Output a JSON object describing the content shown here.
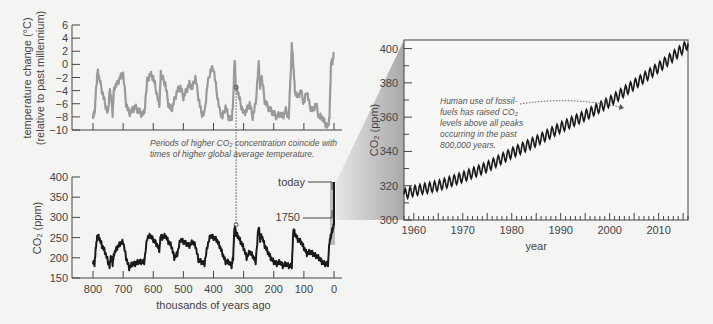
{
  "chart_data": [
    {
      "type": "line",
      "name": "temperature",
      "ylabel": "temperature change (°C)",
      "ylabel2": "(relative to past millennium)",
      "ylim": [
        -10,
        6
      ],
      "yticks": [
        "6",
        "4",
        "2",
        "0",
        "-2",
        "-4",
        "-6",
        "-8",
        "-10"
      ],
      "x_unit": "thousands of years ago",
      "xlim": [
        800,
        0
      ],
      "color": "#9a9a9a",
      "x": [
        800,
        795,
        790,
        785,
        780,
        770,
        760,
        750,
        745,
        740,
        735,
        730,
        720,
        710,
        700,
        690,
        680,
        670,
        660,
        650,
        640,
        630,
        620,
        610,
        600,
        590,
        580,
        575,
        570,
        560,
        550,
        540,
        530,
        520,
        510,
        500,
        490,
        480,
        470,
        460,
        450,
        440,
        430,
        420,
        410,
        400,
        390,
        380,
        370,
        360,
        350,
        340,
        335,
        330,
        325,
        320,
        310,
        300,
        290,
        280,
        270,
        260,
        250,
        245,
        240,
        230,
        220,
        210,
        200,
        190,
        180,
        170,
        160,
        150,
        140,
        135,
        130,
        120,
        110,
        100,
        90,
        80,
        70,
        60,
        50,
        40,
        30,
        20,
        15,
        10,
        5,
        0
      ],
      "y": [
        -7.8,
        -7.5,
        -4,
        -1,
        -2,
        -4,
        -6,
        -7.5,
        -4,
        -5,
        -7.5,
        -3.5,
        -3,
        -2,
        -1.5,
        -6,
        -7.5,
        -7,
        -6.5,
        -7,
        -7.5,
        -7.5,
        -2.5,
        -1.5,
        -2,
        -4,
        -6.5,
        -1.5,
        -2,
        -3,
        -6,
        -7,
        -5.5,
        -4,
        -3.5,
        -5,
        -4,
        -3,
        -3.5,
        -2,
        -5,
        -7.5,
        -7.5,
        -3,
        -1,
        -0.5,
        -4,
        -7,
        -8,
        -6.5,
        -8,
        -8.5,
        -6,
        0.8,
        -3.5,
        -4,
        -6,
        -7.5,
        -7,
        -6,
        -8,
        -6,
        0,
        -3.5,
        -2,
        -5.5,
        -6.5,
        -7,
        -7.5,
        -8,
        -7.5,
        -8,
        -7,
        -8,
        3,
        0,
        -4,
        -5,
        -4,
        -6,
        -4,
        -6.5,
        -7,
        -6,
        -8,
        -8,
        -9,
        -9.5,
        -8,
        0,
        0.5,
        1.5
      ]
    },
    {
      "type": "line",
      "name": "co2_ice_core",
      "ylabel": "CO2 (ppm)",
      "ylim": [
        150,
        400
      ],
      "yticks": [
        "400",
        "350",
        "300",
        "250",
        "200",
        "150"
      ],
      "xlabel": "thousands of years ago",
      "xticks": [
        "800",
        "700",
        "600",
        "500",
        "400",
        "300",
        "200",
        "100",
        "0"
      ],
      "xlim": [
        800,
        0
      ],
      "color": "#1a1a1a",
      "x": [
        800,
        795,
        790,
        785,
        780,
        770,
        760,
        750,
        745,
        740,
        735,
        730,
        720,
        710,
        700,
        690,
        680,
        670,
        660,
        650,
        640,
        630,
        620,
        610,
        600,
        590,
        580,
        575,
        570,
        560,
        550,
        540,
        530,
        520,
        510,
        500,
        490,
        480,
        470,
        460,
        450,
        440,
        430,
        420,
        410,
        400,
        390,
        380,
        370,
        360,
        350,
        340,
        335,
        330,
        325,
        320,
        310,
        300,
        290,
        280,
        270,
        260,
        250,
        245,
        240,
        230,
        220,
        210,
        200,
        190,
        180,
        170,
        160,
        150,
        140,
        135,
        130,
        120,
        110,
        100,
        90,
        80,
        70,
        60,
        50,
        40,
        30,
        20,
        15,
        10,
        5,
        0
      ],
      "y": [
        190,
        185,
        230,
        255,
        250,
        230,
        215,
        190,
        180,
        205,
        185,
        210,
        225,
        235,
        240,
        200,
        175,
        185,
        185,
        190,
        190,
        190,
        250,
        255,
        245,
        235,
        220,
        255,
        250,
        255,
        240,
        230,
        200,
        210,
        245,
        240,
        235,
        230,
        240,
        230,
        195,
        190,
        185,
        230,
        255,
        250,
        245,
        230,
        210,
        190,
        190,
        180,
        200,
        280,
        260,
        255,
        240,
        225,
        200,
        215,
        205,
        190,
        280,
        245,
        255,
        230,
        215,
        200,
        190,
        185,
        190,
        180,
        185,
        180,
        180,
        270,
        260,
        245,
        240,
        225,
        210,
        215,
        210,
        205,
        200,
        190,
        185,
        185,
        240,
        255,
        270,
        280
      ]
    },
    {
      "type": "line",
      "name": "co2_modern",
      "ylabel": "CO2 (ppm)",
      "ylim": [
        300,
        405
      ],
      "yticks": [
        "400",
        "380",
        "360",
        "340",
        "320",
        "300"
      ],
      "xlabel": "year",
      "xticks": [
        "1960",
        "1970",
        "1980",
        "1990",
        "2000",
        "2010"
      ],
      "xlim": [
        1958,
        2016
      ],
      "color": "#1a1a1a",
      "seasonal_amplitude_ppm": 6,
      "x": [
        1958,
        1960,
        1965,
        1970,
        1975,
        1980,
        1985,
        1990,
        1995,
        2000,
        2005,
        2010,
        2015,
        2016
      ],
      "y": [
        315,
        317,
        320,
        325,
        331,
        339,
        346,
        354,
        361,
        369,
        379,
        389,
        400,
        403
      ]
    }
  ],
  "labels": {
    "temp_ylabel_line1": "temperature change (°C)",
    "temp_ylabel_line2": "(relative to past millennium)",
    "co2_left_ylabel": "CO₂ (ppm)",
    "co2_left_xlabel": "thousands of years ago",
    "co2_right_ylabel": "CO₂ (ppm)",
    "co2_right_xlabel": "year",
    "today": "today",
    "year1750": "1750"
  },
  "annotations": {
    "coincide_line1": "Periods of higher CO₂ concentration coincide with",
    "coincide_line2": "times of higher global average temperature.",
    "fossil_line1": "Human use of fossil-",
    "fossil_line2": "fuels has raised CO₂",
    "fossil_line3": "levels above all peaks",
    "fossil_line4": "occurring in the past",
    "fossil_line5": "800,000 years."
  }
}
